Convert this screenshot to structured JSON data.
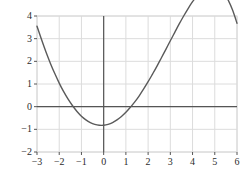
{
  "chart_data": {
    "type": "line",
    "title": "",
    "subtitle": "",
    "xlabel": "",
    "ylabel": "",
    "xlim": [
      -3,
      6
    ],
    "ylim": [
      -2,
      4
    ],
    "grid": true,
    "legend": null,
    "legend_position": "none",
    "x_ticks": [
      -3,
      -2,
      -1,
      0,
      1,
      2,
      3,
      4,
      5,
      6
    ],
    "x_tick_labels": [
      "−3",
      "−2",
      "−1",
      "0",
      "1",
      "2",
      "3",
      "4",
      "5",
      "6"
    ],
    "y_ticks": [
      -2,
      -1,
      0,
      1,
      2,
      3,
      4
    ],
    "y_tick_labels": [
      "−2",
      "−1",
      "0",
      "1",
      "2",
      "3",
      "4"
    ],
    "series": [
      {
        "name": "cubic-curve",
        "color": "#5a5a5a",
        "line_width": 1.4,
        "x": [
          -3.0,
          -2.8,
          -2.6,
          -2.4,
          -2.2,
          -2.0,
          -1.8,
          -1.6,
          -1.4,
          -1.2,
          -1.0,
          -0.8,
          -0.6,
          -0.4,
          -0.2,
          0.0,
          0.2,
          0.4,
          0.6,
          0.8,
          1.0,
          1.2,
          1.4,
          1.6,
          1.8,
          2.0,
          2.2,
          2.4,
          2.6,
          2.8,
          3.0,
          3.2,
          3.4,
          3.6,
          3.8,
          4.0,
          4.2,
          4.4,
          4.6,
          4.8,
          5.0,
          5.2,
          5.4,
          5.6,
          5.8,
          6.0
        ],
        "y": [
          3.55,
          2.97,
          2.42,
          1.92,
          1.46,
          1.04,
          0.66,
          0.33,
          0.04,
          -0.21,
          -0.42,
          -0.58,
          -0.7,
          -0.78,
          -0.82,
          -0.82,
          -0.78,
          -0.7,
          -0.58,
          -0.43,
          -0.25,
          -0.03,
          0.21,
          0.48,
          0.78,
          1.1,
          1.44,
          1.79,
          2.16,
          2.53,
          2.91,
          3.28,
          3.65,
          4.0,
          4.33,
          4.63,
          4.89,
          5.1,
          5.25,
          5.33,
          5.33,
          5.23,
          5.03,
          4.71,
          4.26,
          3.68
        ]
      }
    ],
    "key_points": {
      "left_endpoint": {
        "x": -3,
        "y": 3.55
      },
      "left_root": {
        "x": -1.9,
        "y": 0
      },
      "local_minimum": {
        "x": -0.55,
        "y": -1.5
      },
      "middle_root": {
        "x": 0.87,
        "y": 0
      },
      "local_maximum": {
        "x": 4.0,
        "y": 3.55
      },
      "right_root": {
        "x": 6,
        "y": 0
      }
    },
    "colors": {
      "curve": "#5a5a5a",
      "grid": "#dcdcdc",
      "axis": "#555555",
      "frame": "#d8d8d8",
      "tick_text": "#2b2b2b",
      "background": "#ffffff"
    }
  },
  "figure": {
    "background_color": "#ffffff"
  }
}
